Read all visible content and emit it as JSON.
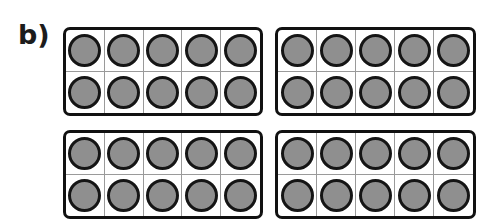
{
  "page": {
    "background_color": "#ffffff",
    "width": 495,
    "height": 223
  },
  "label": {
    "text": "b)",
    "color": "#1c1c1c"
  },
  "manipulative": {
    "kind": "ten-frame",
    "frame_count": 4,
    "columns_per_frame": 5,
    "rows_per_frame": 2,
    "cells_per_frame": 10,
    "counters_per_frame": 10,
    "total_counters": 40,
    "counter_color": "#8f8f8f",
    "counter_outline_color": "#151515",
    "frame_border_color": "#111111",
    "cell_divider_color": "#9a9a9a"
  },
  "frames": [
    {
      "name": "ten-frame-top-left",
      "position": "top-left",
      "filled": 10,
      "rows": [
        [
          true,
          true,
          true,
          true,
          true
        ],
        [
          true,
          true,
          true,
          true,
          true
        ]
      ]
    },
    {
      "name": "ten-frame-top-right",
      "position": "top-right",
      "filled": 10,
      "rows": [
        [
          true,
          true,
          true,
          true,
          true
        ],
        [
          true,
          true,
          true,
          true,
          true
        ]
      ]
    },
    {
      "name": "ten-frame-bottom-left",
      "position": "bottom-left",
      "filled": 10,
      "rows": [
        [
          true,
          true,
          true,
          true,
          true
        ],
        [
          true,
          true,
          true,
          true,
          true
        ]
      ]
    },
    {
      "name": "ten-frame-bottom-right",
      "position": "bottom-right",
      "filled": 10,
      "rows": [
        [
          true,
          true,
          true,
          true,
          true
        ],
        [
          true,
          true,
          true,
          true,
          true
        ]
      ]
    }
  ]
}
